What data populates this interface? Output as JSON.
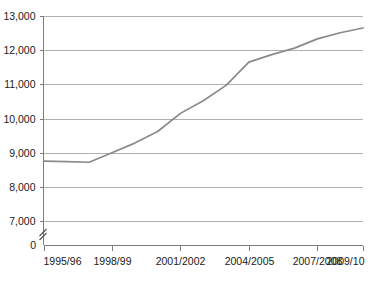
{
  "chart_data": {
    "type": "line",
    "title": "",
    "subtitle": "",
    "xlabel": "",
    "ylabel": "",
    "categories": [
      "1995/96",
      "1996/97",
      "1997/98",
      "1998/99",
      "1999/2000",
      "2000/2001",
      "2001/2002",
      "2002/2003",
      "2003/2004",
      "2004/2005",
      "2005/2006",
      "2006/2007",
      "2007/2008",
      "2008/2009",
      "2009/10"
    ],
    "values": [
      8750,
      8740,
      8720,
      9000,
      9280,
      9620,
      10150,
      10520,
      10970,
      11650,
      11870,
      12060,
      12330,
      12510,
      12650
    ],
    "series": [
      {
        "name": "series-1",
        "color": "#8a8a8a",
        "values": [
          8750,
          8740,
          8720,
          9000,
          9280,
          9620,
          10150,
          10520,
          10970,
          11650,
          11870,
          12060,
          12330,
          12510,
          12650
        ]
      }
    ],
    "ylim": [
      7000,
      13000
    ],
    "y_ticks": [
      7000,
      8000,
      9000,
      10000,
      11000,
      12000,
      13000
    ],
    "y_tick_labels": [
      "7,000",
      "8,000",
      "9,000",
      "10,000",
      "11,000",
      "12,000",
      "13,000"
    ],
    "y_axis_break": true,
    "y_axis_origin_label": "0",
    "x_tick_labels": [
      "1995/96",
      "1998/99",
      "2001/2002",
      "2004/2005",
      "2007/2008",
      "2009/10"
    ],
    "x_tick_indices": [
      0,
      3,
      6,
      9,
      12,
      14
    ],
    "grid": true,
    "grid_axis": "y",
    "legend": false,
    "legend_position": "none",
    "colors": {
      "line": "#8a8a8a",
      "grid": "#b0b0b0",
      "axis": "#7d7d7d",
      "text": "#1a1a1a",
      "background": "#ffffff"
    }
  }
}
